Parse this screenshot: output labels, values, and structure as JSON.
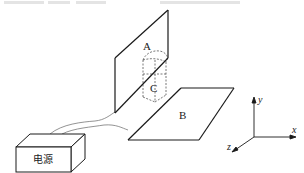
{
  "diagram": {
    "plate_a": {
      "label": "A"
    },
    "plate_b": {
      "label": "B"
    },
    "region_c": {
      "label": "C"
    },
    "power_supply": {
      "label": "电源"
    },
    "axes": {
      "x_label": "x",
      "y_label": "y",
      "z_label": "z"
    }
  },
  "colors": {
    "line": "#1a1a1a",
    "wire": "#666666",
    "dashed": "#555555",
    "faded_text": "#d8d8d8"
  }
}
